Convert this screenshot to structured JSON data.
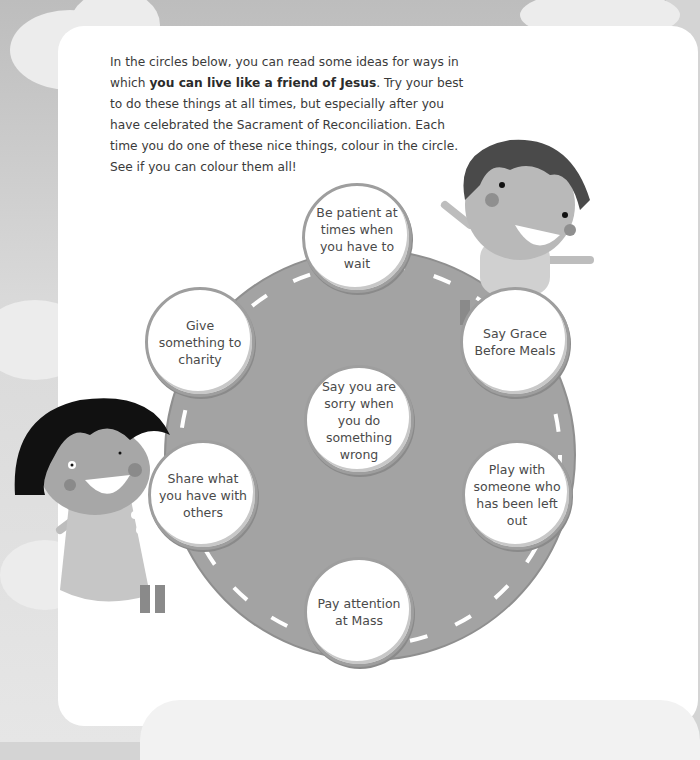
{
  "intro": {
    "before_bold": "In the circles below, you can read some ideas for ways in which ",
    "bold": "you can live like a friend of Jesus",
    "after_bold": ". Try your best to do these things at all times, but especially after you have celebrated the Sacrament of Reconciliation. Each time you do one of these nice things, colour in the circle. See if you can colour them all!"
  },
  "circles": [
    {
      "id": "top",
      "label": "Be patient at times when you have to wait"
    },
    {
      "id": "upper-left",
      "label": "Give something to charity"
    },
    {
      "id": "upper-right",
      "label": "Say Grace Before Meals"
    },
    {
      "id": "center",
      "label": "Say you are sorry when you do something wrong"
    },
    {
      "id": "lower-left",
      "label": "Share what you have with others"
    },
    {
      "id": "lower-right",
      "label": "Play with someone who has been left out"
    },
    {
      "id": "bottom",
      "label": "Pay attention at Mass"
    }
  ],
  "colors": {
    "road": "#a3a3a3",
    "road_dash": "#ffffff",
    "circle_border": "#9e9e9e",
    "text": "#4a4a4a"
  }
}
